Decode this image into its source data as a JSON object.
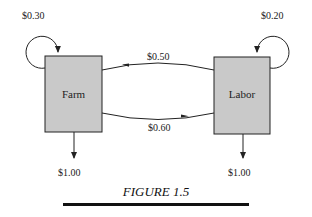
{
  "figure": {
    "caption": "FIGURE 1.5",
    "nodes": [
      {
        "id": "farm",
        "label": "Farm",
        "self_loop": "$0.30",
        "output": "$1.00"
      },
      {
        "id": "labor",
        "label": "Labor",
        "self_loop": "$0.20",
        "output": "$1.00"
      }
    ],
    "edges": [
      {
        "from": "labor",
        "to": "farm",
        "label": "$0.50"
      },
      {
        "from": "farm",
        "to": "labor",
        "label": "$0.60"
      }
    ],
    "colors": {
      "box_fill": "#c9c9c9",
      "stroke": "#222222"
    }
  }
}
